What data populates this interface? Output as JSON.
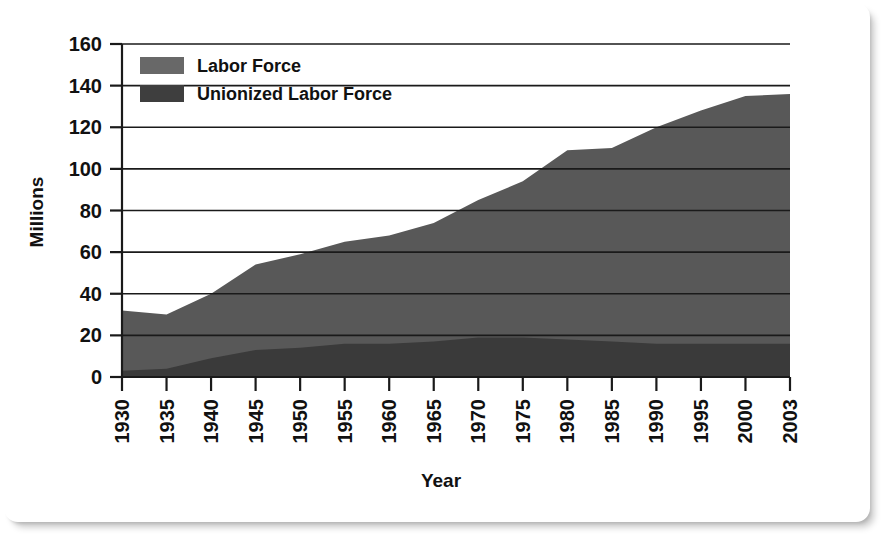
{
  "chart_data": {
    "type": "area",
    "stacked": true,
    "title": "",
    "xlabel": "Year",
    "ylabel": "Millions",
    "xlim": [
      1930,
      2003
    ],
    "ylim": [
      0,
      160
    ],
    "ytick_step": 20,
    "grid": "horizontal",
    "legend_position": "top-left",
    "categories": [
      1930,
      1935,
      1940,
      1945,
      1950,
      1955,
      1960,
      1965,
      1970,
      1975,
      1980,
      1985,
      1990,
      1995,
      2000,
      2003
    ],
    "tick_labels": [
      "1930",
      "1935",
      "1940",
      "1945",
      "1950",
      "1955",
      "1960",
      "1965",
      "1970",
      "1975",
      "1980",
      "1985",
      "1990",
      "1995",
      "2000",
      "2003"
    ],
    "ytick_labels": [
      "0",
      "20",
      "40",
      "60",
      "80",
      "100",
      "120",
      "140",
      "160"
    ],
    "ytick_values": [
      0,
      20,
      40,
      60,
      80,
      100,
      120,
      140,
      160
    ],
    "series": [
      {
        "name": "Labor Force",
        "color": "#585858",
        "values": [
          32,
          30,
          40,
          54,
          59,
          65,
          68,
          74,
          85,
          94,
          109,
          110,
          120,
          128,
          135,
          136
        ]
      },
      {
        "name": "Unionized Labor Force",
        "color": "#3a3a3a",
        "values": [
          3,
          4,
          9,
          13,
          14,
          16,
          16,
          17,
          19,
          19,
          18,
          17,
          16,
          16,
          16,
          16
        ]
      }
    ]
  },
  "legend": {
    "items": [
      {
        "label": "Labor Force",
        "swatch_color": "#686868"
      },
      {
        "label": "Unionized Labor Force",
        "swatch_color": "#3e3e3e"
      }
    ]
  },
  "axes": {
    "x_title": "Year",
    "y_title": "Millions"
  },
  "colors": {
    "axis": "#1a1a1a",
    "gridline": "#1a1a1a",
    "text": "#111111",
    "background": "#ffffff",
    "labor_force_fill": "#585858",
    "unionized_fill": "#3a3a3a"
  }
}
